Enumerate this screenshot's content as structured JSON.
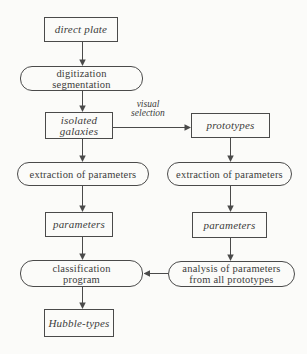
{
  "diagram": {
    "type": "flowchart",
    "colors": {
      "background": "#fbfbf9",
      "line": "#4a4a4a",
      "text": "#3b3b3b"
    },
    "nodes": {
      "direct_plate": {
        "label": "direct plate",
        "shape": "rectangle"
      },
      "digitization": {
        "label": "digitization\nsegmentation",
        "shape": "stadium"
      },
      "isolated_galaxies": {
        "label": "isolated\ngalaxies",
        "shape": "rectangle"
      },
      "prototypes": {
        "label": "prototypes",
        "shape": "rectangle"
      },
      "extraction_left": {
        "label": "extraction of parameters",
        "shape": "stadium"
      },
      "extraction_right": {
        "label": "extraction of parameters",
        "shape": "stadium"
      },
      "parameters_left": {
        "label": "parameters",
        "shape": "rectangle"
      },
      "parameters_right": {
        "label": "parameters",
        "shape": "rectangle"
      },
      "classification": {
        "label": "classification\nprogram",
        "shape": "stadium"
      },
      "analysis": {
        "label": "analysis of parameters\nfrom all prototypes",
        "shape": "stadium"
      },
      "hubble_types": {
        "label": "Hubble-types",
        "shape": "rectangle"
      }
    },
    "edge_labels": {
      "visual_selection": "visual\nselection"
    },
    "edges": [
      {
        "from": "direct_plate",
        "to": "digitization"
      },
      {
        "from": "digitization",
        "to": "isolated_galaxies"
      },
      {
        "from": "isolated_galaxies",
        "to": "prototypes",
        "label": "visual selection"
      },
      {
        "from": "isolated_galaxies",
        "to": "extraction_left"
      },
      {
        "from": "prototypes",
        "to": "extraction_right"
      },
      {
        "from": "extraction_left",
        "to": "parameters_left"
      },
      {
        "from": "extraction_right",
        "to": "parameters_right"
      },
      {
        "from": "parameters_left",
        "to": "classification"
      },
      {
        "from": "parameters_right",
        "to": "analysis"
      },
      {
        "from": "analysis",
        "to": "classification"
      },
      {
        "from": "classification",
        "to": "hubble_types"
      }
    ]
  }
}
